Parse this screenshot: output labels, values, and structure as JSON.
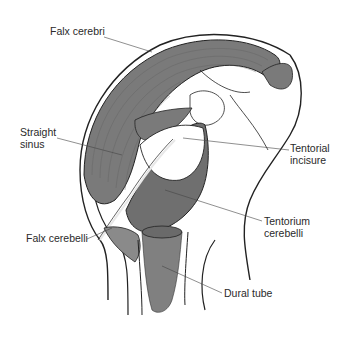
{
  "diagram": {
    "colors": {
      "dura_fill": "#7a7a7a",
      "dura_fill_dark": "#6a6a6a",
      "dura_fill_light": "#9a9a9a",
      "outline": "#222222",
      "leader_line": "#444444",
      "text": "#2a2a2a",
      "background": "#ffffff"
    },
    "labels": [
      {
        "id": "falx-cerebri",
        "line1": "Falx cerebri",
        "line2": ""
      },
      {
        "id": "straight-sinus",
        "line1": "Straight",
        "line2": "sinus"
      },
      {
        "id": "tentorial-incisure",
        "line1": "Tentorial",
        "line2": "incisure"
      },
      {
        "id": "falx-cerebelli",
        "line1": "Falx cerebelli",
        "line2": ""
      },
      {
        "id": "tentorium-cerebelli",
        "line1": "Tentorium",
        "line2": "cerebelli"
      },
      {
        "id": "dural-tube",
        "line1": "Dural tube",
        "line2": ""
      }
    ]
  }
}
